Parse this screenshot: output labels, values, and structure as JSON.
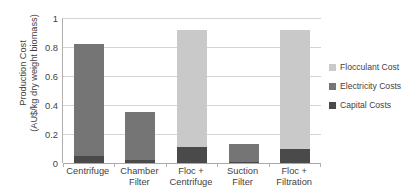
{
  "chart_data": {
    "type": "bar",
    "subtype": "stacked-bar-vertical",
    "title": "",
    "xlabel": "",
    "ylabel": "Production Cost (AU$/kg dry weight biomass)",
    "ylabel_line1": "Production Cost",
    "ylabel_line2": "(AU$/kg dry weight biomass)",
    "categories": [
      "Centrifuge",
      "Chamber Filter",
      "Floc + Centrifuge",
      "Suction Filter",
      "Floc + Filtration"
    ],
    "category_lines": [
      [
        "Centrifuge"
      ],
      [
        "Chamber",
        "Filter"
      ],
      [
        "Floc +",
        "Centrifuge"
      ],
      [
        "Suction",
        "Filter"
      ],
      [
        "Floc +",
        "Filtration"
      ]
    ],
    "series": [
      {
        "name": "Capital Costs",
        "color": "#4a4a4a",
        "values": [
          0.05,
          0.02,
          0.11,
          0.01,
          0.1
        ]
      },
      {
        "name": "Electricity Costs",
        "color": "#757575",
        "values": [
          0.77,
          0.33,
          0.0,
          0.12,
          0.0
        ]
      },
      {
        "name": "Flocculant Cost",
        "color": "#c9c9c9",
        "values": [
          0.0,
          0.0,
          0.81,
          0.0,
          0.82
        ]
      }
    ],
    "totals": [
      0.82,
      0.35,
      0.92,
      0.13,
      0.92
    ],
    "ylim": [
      0,
      1
    ],
    "yticks": [
      0,
      0.2,
      0.4,
      0.6,
      0.8,
      1
    ],
    "ytick_labels": [
      "0",
      "0.2",
      "0.4",
      "0.6",
      "0.8",
      "1"
    ],
    "grid": true,
    "grid_axis": "y",
    "legend_position": "right",
    "legend_order": [
      "Flocculant Cost",
      "Electricity Costs",
      "Capital Costs"
    ]
  },
  "legend": {
    "items": [
      {
        "label": "Flocculant Cost",
        "color": "#c9c9c9"
      },
      {
        "label": "Electricity Costs",
        "color": "#757575"
      },
      {
        "label": "Capital Costs",
        "color": "#4a4a4a"
      }
    ]
  }
}
